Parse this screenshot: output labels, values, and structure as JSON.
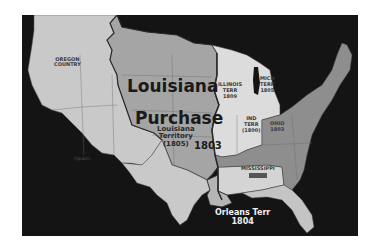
{
  "map": {
    "title_line1": "Louisiana",
    "title_line2": "Purchase",
    "subtitle_line1": "Louisiana",
    "subtitle_line2": "Territory",
    "subtitle_line3": "(1805)",
    "purchase_year": "1803",
    "regions": {
      "oregon": {
        "line1": "OREGON",
        "line2": "COUNTRY"
      },
      "spain": {
        "label": "(Spain)"
      },
      "illinois": {
        "line1": "ILLINOIS",
        "line2": "TERR",
        "line3": "1809"
      },
      "michigan": {
        "line1": "MICH",
        "line2": "TERR",
        "line3": "1805"
      },
      "indiana": {
        "line1": "IND",
        "line2": "TERR",
        "line3": "(1800)"
      },
      "ohio": {
        "line1": "OHIO",
        "line2": "1803"
      },
      "mississippi": {
        "line1": "MISSISSIPPI"
      },
      "orleans": {
        "line1": "Orleans Terr",
        "line2": "1804"
      }
    },
    "colors": {
      "water": "#141414",
      "west_territory": "#c9c9c9",
      "louisiana_purchase": "#a5a5a5",
      "northwest_territories": "#dcdcdc",
      "united_states": "#8e8e8e",
      "boundary": "#2a2a2a"
    }
  }
}
